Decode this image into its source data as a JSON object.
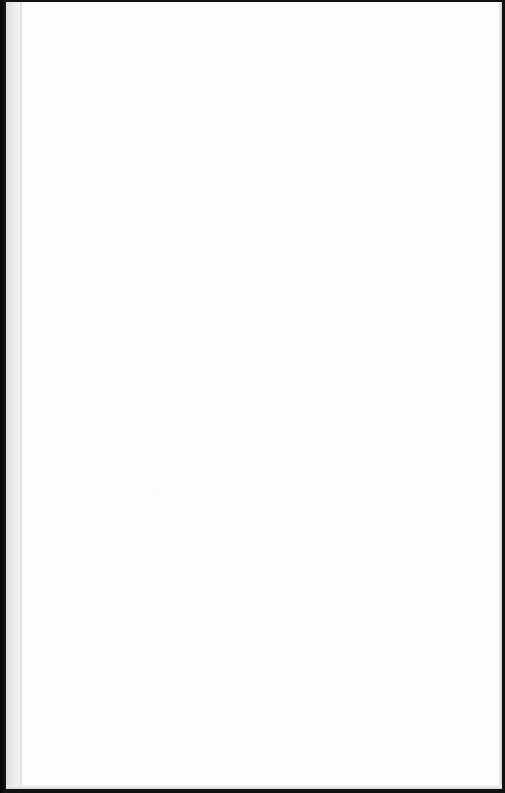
{
  "document": {
    "type": "scanned-blank-page",
    "page_text": "",
    "faint_mark": "· ·"
  },
  "colors": {
    "binding": "#111111",
    "page": "#fdfdfd",
    "gutter": "#e2e2e2"
  }
}
